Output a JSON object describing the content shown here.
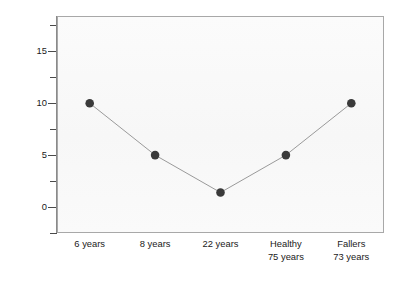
{
  "chart_data": {
    "type": "line",
    "title": "",
    "subtitle": "",
    "xlabel": "",
    "ylabel": "Percentage Errors (search time > 20 sec)",
    "categories": [
      "6 years",
      "8 years",
      "22 years",
      "Healthy 75 years",
      "Fallers 73 years"
    ],
    "category_lines": [
      [
        "6 years"
      ],
      [
        "8 years"
      ],
      [
        "22 years"
      ],
      [
        "Healthy",
        "75 years"
      ],
      [
        "Fallers",
        "73 years"
      ]
    ],
    "values": [
      10,
      5,
      1.4,
      5,
      10
    ],
    "series": [
      {
        "name": "Percentage Errors",
        "values": [
          10,
          5,
          1.4,
          5,
          10
        ]
      }
    ],
    "ylim": [
      -2.5,
      18.4
    ],
    "ytick_labels": [
      "0",
      "5",
      "10",
      "15"
    ],
    "ytick_values": [
      0,
      5,
      10,
      15
    ],
    "yminor_tick_values": [
      -2.5,
      2.5,
      7.5,
      12.5,
      17.5
    ],
    "grid": false,
    "legend": false,
    "legend_position": "none",
    "marker": "filled-circle",
    "marker_color": "#3a3a3a",
    "line_color": "#9a9a9a",
    "plot_background": "#fafafa",
    "frame_color": "#a8a8a8",
    "annotations": []
  },
  "figure": {
    "background": "#ffffff",
    "axis_title_y": "Percentage Errors (search time > 20 sec)"
  }
}
